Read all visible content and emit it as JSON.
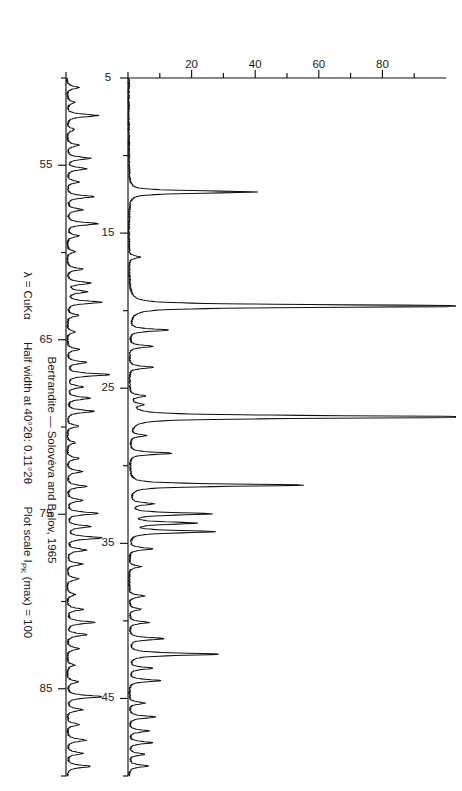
{
  "figure": {
    "kind": "x-ray-powder-diffraction-pattern",
    "caption_line1": "Bertrandite — Solovéva and Belov, 1965",
    "caption_line2_parts": {
      "lambda": "λ = CuKα",
      "halfwidth": "Half width at 40°2θ: 0.11°2θ",
      "plotscale_pre": "Plot scale I",
      "plotscale_sub": "PK",
      "plotscale_post": " (max) = 100"
    },
    "caption_line2_plain": "λ = CuKα   Half width at 40°2θ: 0.11°2θ    Plot scale I_PK (max) = 100"
  },
  "chart_data": {
    "type": "line",
    "title": "Bertrandite — Solovéva and Belov, 1965",
    "xlabel": "°2θ (CuKα)",
    "ylabel": "I_PK",
    "ylim": [
      0,
      100
    ],
    "grid": false,
    "legend": null,
    "y_ticks_major": [
      20,
      40,
      60,
      80
    ],
    "y_ticks_minor": [
      10,
      30,
      50,
      70,
      90
    ],
    "y_tick_labels": [
      "20",
      "40",
      "60",
      "80"
    ],
    "panels": [
      {
        "name": "upper-trace",
        "xlim": [
          5,
          50
        ],
        "x_ticks_major": [
          5,
          15,
          25,
          35,
          45
        ],
        "x_ticks_minor": [
          10,
          20,
          30,
          40,
          50
        ],
        "x_tick_labels": [
          "5",
          "15",
          "25",
          "35",
          "45"
        ],
        "vertical_scale": 1,
        "peaks": [
          {
            "x": 12.35,
            "i": 33
          },
          {
            "x": 16.55,
            "i": 3
          },
          {
            "x": 19.7,
            "i": 97
          },
          {
            "x": 21.25,
            "i": 10
          },
          {
            "x": 22.3,
            "i": 6
          },
          {
            "x": 23.65,
            "i": 6
          },
          {
            "x": 25.5,
            "i": 4
          },
          {
            "x": 26.05,
            "i": 3
          },
          {
            "x": 26.85,
            "i": 100
          },
          {
            "x": 28.05,
            "i": 4
          },
          {
            "x": 29.2,
            "i": 11
          },
          {
            "x": 31.25,
            "i": 45
          },
          {
            "x": 32.45,
            "i": 6
          },
          {
            "x": 33.1,
            "i": 21
          },
          {
            "x": 33.7,
            "i": 17
          },
          {
            "x": 34.25,
            "i": 22
          },
          {
            "x": 35.35,
            "i": 6
          },
          {
            "x": 36.5,
            "i": 3
          },
          {
            "x": 38.4,
            "i": 4
          },
          {
            "x": 39.25,
            "i": 3
          },
          {
            "x": 40.1,
            "i": 5
          },
          {
            "x": 41.15,
            "i": 9
          },
          {
            "x": 42.15,
            "i": 23
          },
          {
            "x": 43.05,
            "i": 6
          },
          {
            "x": 43.85,
            "i": 8
          },
          {
            "x": 45.3,
            "i": 4
          },
          {
            "x": 46.2,
            "i": 7
          },
          {
            "x": 47.1,
            "i": 5
          },
          {
            "x": 47.85,
            "i": 6
          },
          {
            "x": 48.6,
            "i": 4
          },
          {
            "x": 49.35,
            "i": 5
          }
        ]
      },
      {
        "name": "lower-trace",
        "xlim": [
          50,
          90
        ],
        "x_ticks_major": [
          55,
          65,
          75,
          85
        ],
        "x_ticks_minor": [
          50,
          60,
          70,
          80,
          90
        ],
        "x_tick_labels": [
          "55",
          "65",
          "75",
          "85"
        ],
        "vertical_scale": 1,
        "peaks": [
          {
            "x": 50.55,
            "i": 3
          },
          {
            "x": 51.4,
            "i": 2
          },
          {
            "x": 52.15,
            "i": 8
          },
          {
            "x": 52.95,
            "i": 2
          },
          {
            "x": 53.85,
            "i": 3
          },
          {
            "x": 54.6,
            "i": 6
          },
          {
            "x": 55.2,
            "i": 5
          },
          {
            "x": 55.95,
            "i": 3
          },
          {
            "x": 56.8,
            "i": 7
          },
          {
            "x": 57.55,
            "i": 4
          },
          {
            "x": 58.35,
            "i": 8
          },
          {
            "x": 59.05,
            "i": 3
          },
          {
            "x": 59.95,
            "i": 2
          },
          {
            "x": 60.95,
            "i": 4
          },
          {
            "x": 61.75,
            "i": 6
          },
          {
            "x": 62.25,
            "i": 5
          },
          {
            "x": 62.85,
            "i": 9
          },
          {
            "x": 63.6,
            "i": 3
          },
          {
            "x": 64.55,
            "i": 2
          },
          {
            "x": 65.55,
            "i": 3
          },
          {
            "x": 66.3,
            "i": 5
          },
          {
            "x": 67.0,
            "i": 11
          },
          {
            "x": 67.7,
            "i": 4
          },
          {
            "x": 68.35,
            "i": 6
          },
          {
            "x": 69.1,
            "i": 7
          },
          {
            "x": 69.95,
            "i": 3
          },
          {
            "x": 70.9,
            "i": 2
          },
          {
            "x": 71.8,
            "i": 3
          },
          {
            "x": 72.55,
            "i": 4
          },
          {
            "x": 73.4,
            "i": 5
          },
          {
            "x": 74.2,
            "i": 4
          },
          {
            "x": 74.95,
            "i": 8
          },
          {
            "x": 75.7,
            "i": 6
          },
          {
            "x": 76.35,
            "i": 9
          },
          {
            "x": 77.05,
            "i": 5
          },
          {
            "x": 77.85,
            "i": 4
          },
          {
            "x": 78.7,
            "i": 3
          },
          {
            "x": 79.6,
            "i": 2
          },
          {
            "x": 80.45,
            "i": 4
          },
          {
            "x": 81.2,
            "i": 7
          },
          {
            "x": 81.9,
            "i": 5
          },
          {
            "x": 82.7,
            "i": 3
          },
          {
            "x": 83.65,
            "i": 2
          },
          {
            "x": 84.6,
            "i": 3
          },
          {
            "x": 85.45,
            "i": 9
          },
          {
            "x": 86.2,
            "i": 4
          },
          {
            "x": 87.05,
            "i": 3
          },
          {
            "x": 87.95,
            "i": 5
          },
          {
            "x": 88.7,
            "i": 4
          },
          {
            "x": 89.45,
            "i": 6
          }
        ]
      }
    ]
  }
}
